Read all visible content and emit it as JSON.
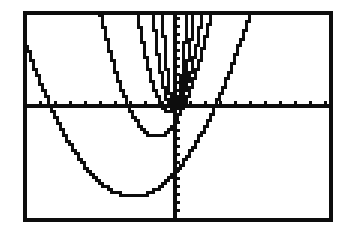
{
  "screen": {
    "device_label": "graphing-calculator-screen",
    "background_color": "#ffffff",
    "ink_color": "#0d0d0d",
    "frame": {
      "x": 23,
      "y": 11,
      "width": 310,
      "height": 211,
      "border_width": 4
    }
  },
  "chart_data": {
    "type": "line",
    "title": "",
    "subtitle": "",
    "xlabel": "",
    "ylabel": "",
    "grid": false,
    "legend": null,
    "legend_position": "none",
    "render_style": "pixelated-stairstep",
    "axes": {
      "origin_px": {
        "x": 175,
        "y": 106
      },
      "x_axis": {
        "visible": true,
        "pixel_y": 106,
        "pixel_x_start": 27,
        "pixel_x_end": 329,
        "tick_spacing_px": 15,
        "tick_length_px": 5,
        "tick_count": 21,
        "range": [
          -10,
          10
        ],
        "scale_px_per_unit": 15,
        "tick_labels": []
      },
      "y_axis": {
        "visible": true,
        "pixel_x": 175,
        "pixel_y_start": 15,
        "pixel_y_end": 218,
        "tick_spacing_px": 8,
        "tick_length_px": 5,
        "tick_count": 25,
        "range": [
          -7,
          6
        ],
        "scale_px_per_unit": 15,
        "tick_labels": []
      }
    },
    "xlim": [
      -10,
      10
    ],
    "ylim": [
      -7.5,
      6.3
    ],
    "series": [
      {
        "name": "widest-parabola",
        "equation": "y = 0.2x^2 + 1.4x - 3.9",
        "vertex": {
          "x": -2.8,
          "y": -6.0
        },
        "leading_coefficient": 0.2,
        "vertex_px": {
          "x": 133,
          "y": 196
        },
        "x_intercepts": [
          -8.3,
          2.2
        ],
        "stroke_width": 3
      },
      {
        "name": "wide-parabola",
        "equation": "y = 0.6x^2 + 1.5x - 1.1",
        "vertex": {
          "x": -1.25,
          "y": -2.0
        },
        "leading_coefficient": 0.6,
        "vertex_px": {
          "x": 206,
          "y": 140
        },
        "x_intercepts": [
          -3.1,
          0.6
        ],
        "stroke_width": 3
      },
      {
        "name": "medium-parabola",
        "equation": "y = 1.4x^2 + 0.9x - 0.2",
        "vertex": {
          "x": -0.32,
          "y": -0.35
        },
        "leading_coefficient": 1.4,
        "vertex_px": {
          "x": 180,
          "y": 111
        },
        "x_intercepts": [
          -0.84,
          0.19
        ],
        "stroke_width": 3
      },
      {
        "name": "narrow-parabola",
        "equation": "y = 3.4x^2 + 0.7x - 0.1",
        "vertex": {
          "x": -0.1,
          "y": -0.14
        },
        "leading_coefficient": 3.4,
        "vertex_px": {
          "x": 177,
          "y": 108
        },
        "x_intercepts": [
          -0.31,
          0.1
        ],
        "stroke_width": 3
      },
      {
        "name": "narrowest-parabola",
        "equation": "y = 9.0x^2 + 0.4x",
        "vertex": {
          "x": -0.02,
          "y": -0.004
        },
        "leading_coefficient": 9.0,
        "vertex_px": {
          "x": 176,
          "y": 107
        },
        "x_intercepts": [
          -0.04,
          0.0
        ],
        "stroke_width": 3
      }
    ],
    "top_edge_crossings_px": [
      70,
      133,
      148,
      170,
      177,
      193,
      217,
      253
    ],
    "annotations": []
  }
}
